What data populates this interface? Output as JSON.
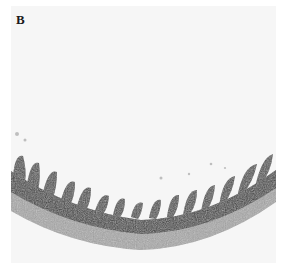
{
  "figure": {
    "panel_label": "B",
    "colors": {
      "background": "#f6f6f6",
      "tissue_dark": "#3a3a3a",
      "tissue_mid": "#7a7a7a",
      "tissue_light": "#a9a9a9"
    }
  }
}
